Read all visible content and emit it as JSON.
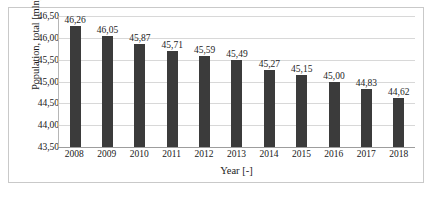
{
  "chart_data": {
    "type": "bar",
    "title": "",
    "xlabel": "Year [-]",
    "ylabel": "Population, total [mln]",
    "categories": [
      "2008",
      "2009",
      "2010",
      "2011",
      "2012",
      "2013",
      "2014",
      "2015",
      "2016",
      "2017",
      "2018"
    ],
    "values": [
      46.26,
      46.05,
      45.87,
      45.71,
      45.59,
      45.49,
      45.27,
      45.15,
      45.0,
      44.83,
      44.62
    ],
    "value_labels": [
      "46,26",
      "46,05",
      "45,87",
      "45,71",
      "45,59",
      "45,49",
      "45,27",
      "45,15",
      "45,00",
      "44,83",
      "44,62"
    ],
    "ylim": [
      43.5,
      46.5
    ],
    "ytick_values": [
      43.5,
      44.0,
      44.5,
      45.0,
      45.5,
      46.0,
      46.5
    ],
    "ytick_labels": [
      "43,50",
      "44,00",
      "44,50",
      "45,00",
      "45,50",
      "46,00",
      "46,50"
    ],
    "grid": true,
    "legend": false,
    "legend_position": "none",
    "bar_color": "#3b3b3b",
    "gridline_color": "#d8d8d8",
    "axis_color": "#9d9d9d",
    "frame_color": "#c9c9c9",
    "decimal_separator": ","
  },
  "caption": {
    "text": ""
  }
}
